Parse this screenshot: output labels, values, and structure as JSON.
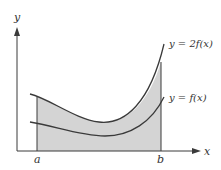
{
  "diagram": {
    "axes": {
      "x_label": "x",
      "y_label": "y"
    },
    "bounds": {
      "a_label": "a",
      "b_label": "b"
    },
    "curves": [
      {
        "name": "upper",
        "label": "y = 2f(x)"
      },
      {
        "name": "lower",
        "label": "y = f(x)"
      }
    ],
    "shaded_region": "area under y = 2f(x) from a to b",
    "colors": {
      "shade": "#d4d4d4",
      "stroke": "#3a3a3a",
      "background": "#ffffff"
    }
  }
}
